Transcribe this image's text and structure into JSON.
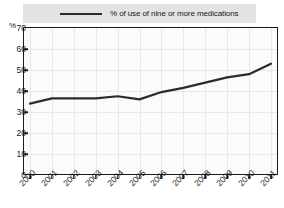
{
  "chart_data": {
    "type": "line",
    "title": "",
    "xlabel": "",
    "ylabel": "%",
    "ylim": [
      0,
      70
    ],
    "ytick_values": [
      70,
      60,
      50,
      40,
      30,
      20,
      10,
      0
    ],
    "grid": true,
    "legend_position": "top",
    "categories": [
      "2000",
      "2001",
      "2002",
      "2003",
      "2004",
      "2005",
      "2006",
      "2007",
      "2008",
      "2009",
      "2010",
      "2011"
    ],
    "series": [
      {
        "name": "% of use of nine or more medications",
        "color": "#2b2b2b",
        "values": [
          34,
          36.5,
          36.5,
          36.5,
          37.5,
          36,
          39.5,
          41.5,
          44,
          46.5,
          48,
          53
        ]
      }
    ]
  },
  "legend": {
    "entries": [
      {
        "label": "% of use of nine or more medications",
        "color": "#2b2b2b"
      }
    ]
  },
  "axes": {
    "y_unit_label": "%",
    "y_ticks": [
      "70",
      "60",
      "50",
      "40",
      "30",
      "20",
      "10",
      "0"
    ],
    "x_ticks": [
      "2000",
      "2001",
      "2002",
      "2003",
      "2004",
      "2005",
      "2006",
      "2007",
      "2008",
      "2009",
      "2010",
      "2011"
    ]
  },
  "colors": {
    "line": "#2b2b2b",
    "legend_background": "#e3e3e3",
    "plot_background": "#fbfbfb",
    "grid": "#e8e8e8",
    "axis": "#1a1a1a"
  }
}
